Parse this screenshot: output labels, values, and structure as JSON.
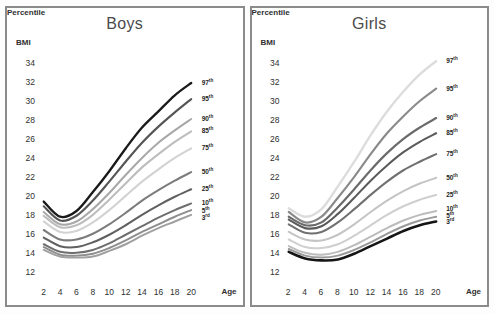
{
  "figure": {
    "background_color": "#fdfdfd",
    "panel_border_color": "#8b8b8b"
  },
  "panels": [
    {
      "id": "boys",
      "title": "Boys",
      "y_axis_name": "BMI",
      "x_axis_name": "Age",
      "legend_title": "Percentile"
    },
    {
      "id": "girls",
      "title": "Girls",
      "y_axis_name": "BMI",
      "x_axis_name": "Age",
      "legend_title": "Percentile"
    }
  ],
  "axis": {
    "y_ticks": [
      34,
      32,
      30,
      28,
      26,
      24,
      22,
      20,
      18,
      16,
      14,
      12
    ],
    "x_ticks": [
      2,
      4,
      6,
      8,
      10,
      12,
      14,
      16,
      18,
      20
    ],
    "ylim": [
      11,
      35
    ],
    "xlim": [
      1.2,
      20.8
    ]
  },
  "chart_data": [
    {
      "type": "line",
      "title": "Boys",
      "xlabel": "Age",
      "ylabel": "BMI",
      "xlim": [
        1.2,
        20.8
      ],
      "ylim": [
        11,
        35
      ],
      "grid": false,
      "legend_position": "right-inline",
      "x": [
        2,
        4,
        6,
        8,
        10,
        12,
        14,
        16,
        18,
        20
      ],
      "series": [
        {
          "name": "97th",
          "label": "97",
          "suffix": "th",
          "color": "#1a1a1a",
          "width": 2.4,
          "values": [
            19.4,
            17.8,
            18.4,
            20.4,
            22.6,
            25.0,
            27.2,
            28.9,
            30.6,
            31.9
          ]
        },
        {
          "name": "95th",
          "label": "95",
          "suffix": "th",
          "color": "#555555",
          "width": 2.2,
          "values": [
            18.9,
            17.4,
            17.9,
            19.5,
            21.5,
            23.6,
            25.6,
            27.3,
            28.8,
            30.2
          ]
        },
        {
          "name": "90th",
          "label": "90",
          "suffix": "th",
          "color": "#a8a8a8",
          "width": 2.1,
          "values": [
            18.3,
            17.0,
            17.3,
            18.6,
            20.3,
            22.2,
            24.0,
            25.6,
            26.9,
            28.1
          ]
        },
        {
          "name": "85th",
          "label": "85",
          "suffix": "th",
          "color": "#bdbdbd",
          "width": 2.1,
          "values": [
            17.9,
            16.7,
            16.9,
            18.0,
            19.6,
            21.3,
            23.0,
            24.4,
            25.7,
            26.8
          ]
        },
        {
          "name": "75th",
          "label": "75",
          "suffix": "th",
          "color": "#d2d2d2",
          "width": 2.1,
          "values": [
            17.3,
            16.2,
            16.3,
            17.2,
            18.5,
            20.0,
            21.5,
            22.8,
            24.0,
            25.0
          ]
        },
        {
          "name": "50th",
          "label": "50",
          "suffix": "th",
          "color": "#7c7c7c",
          "width": 2.1,
          "values": [
            16.4,
            15.4,
            15.4,
            16.0,
            17.0,
            18.2,
            19.5,
            20.6,
            21.6,
            22.5
          ]
        },
        {
          "name": "25th",
          "label": "25",
          "suffix": "th",
          "color": "#606060",
          "width": 2.1,
          "values": [
            15.6,
            14.7,
            14.6,
            15.1,
            15.9,
            16.9,
            18.0,
            19.0,
            19.9,
            20.7
          ]
        },
        {
          "name": "10th",
          "label": "10",
          "suffix": "th",
          "color": "#6e6e6e",
          "width": 2.0,
          "values": [
            14.9,
            14.1,
            14.0,
            14.3,
            15.0,
            15.9,
            16.8,
            17.7,
            18.5,
            19.2
          ]
        },
        {
          "name": "5th",
          "label": "5",
          "suffix": "th",
          "color": "#8e8e8e",
          "width": 2.0,
          "values": [
            14.6,
            13.8,
            13.7,
            13.9,
            14.5,
            15.3,
            16.2,
            17.0,
            17.8,
            18.5
          ]
        },
        {
          "name": "3rd",
          "label": "3",
          "suffix": "rd",
          "color": "#a0a0a0",
          "width": 2.0,
          "values": [
            14.3,
            13.6,
            13.5,
            13.6,
            14.2,
            14.9,
            15.8,
            16.6,
            17.3,
            18.0
          ]
        }
      ]
    },
    {
      "type": "line",
      "title": "Girls",
      "xlabel": "Age",
      "ylabel": "BMI",
      "xlim": [
        1.2,
        20.8
      ],
      "ylim": [
        11,
        35
      ],
      "grid": false,
      "legend_position": "right-inline",
      "x": [
        2,
        4,
        6,
        8,
        10,
        12,
        14,
        16,
        18,
        20
      ],
      "series": [
        {
          "name": "97th",
          "label": "97",
          "suffix": "th",
          "color": "#dcdcdc",
          "width": 2.4,
          "values": [
            18.7,
            17.8,
            18.6,
            21.0,
            23.6,
            26.4,
            28.9,
            31.0,
            32.8,
            34.2
          ]
        },
        {
          "name": "95th",
          "label": "95",
          "suffix": "th",
          "color": "#8a8a8a",
          "width": 2.2,
          "values": [
            18.3,
            17.2,
            17.8,
            19.8,
            22.0,
            24.4,
            26.6,
            28.4,
            30.0,
            31.3
          ]
        },
        {
          "name": "90th",
          "label": "90",
          "suffix": "th",
          "color": "#6a6a6a",
          "width": 2.2,
          "values": [
            17.8,
            16.9,
            17.2,
            18.8,
            20.7,
            22.7,
            24.5,
            26.0,
            27.2,
            28.2
          ]
        },
        {
          "name": "85th",
          "label": "85",
          "suffix": "th",
          "color": "#5a5a5a",
          "width": 2.1,
          "values": [
            17.5,
            16.6,
            16.8,
            18.1,
            19.8,
            21.6,
            23.2,
            24.6,
            25.7,
            26.6
          ]
        },
        {
          "name": "75th",
          "label": "75",
          "suffix": "th",
          "color": "#707070",
          "width": 2.1,
          "values": [
            17.0,
            16.1,
            16.2,
            17.2,
            18.6,
            20.1,
            21.5,
            22.7,
            23.6,
            24.4
          ]
        },
        {
          "name": "50th",
          "label": "50",
          "suffix": "th",
          "color": "#c4c4c4",
          "width": 2.1,
          "values": [
            16.2,
            15.4,
            15.3,
            15.9,
            17.0,
            18.3,
            19.5,
            20.5,
            21.3,
            21.9
          ]
        },
        {
          "name": "25th",
          "label": "25",
          "suffix": "th",
          "color": "#cfcfcf",
          "width": 2.1,
          "values": [
            15.4,
            14.6,
            14.5,
            14.9,
            15.8,
            16.9,
            18.0,
            18.9,
            19.6,
            20.1
          ]
        },
        {
          "name": "10th",
          "label": "10",
          "suffix": "th",
          "color": "#bcbcbc",
          "width": 2.0,
          "values": [
            14.7,
            14.0,
            13.8,
            14.1,
            14.8,
            15.7,
            16.6,
            17.4,
            18.0,
            18.4
          ]
        },
        {
          "name": "5th",
          "label": "5",
          "suffix": "th",
          "color": "#9a9a9a",
          "width": 2.0,
          "values": [
            14.4,
            13.7,
            13.5,
            13.7,
            14.3,
            15.1,
            16.0,
            16.8,
            17.4,
            17.8
          ]
        },
        {
          "name": "3rd",
          "label": "3",
          "suffix": "rd",
          "color": "#151515",
          "width": 2.6,
          "values": [
            14.1,
            13.4,
            13.2,
            13.3,
            13.9,
            14.7,
            15.5,
            16.3,
            16.9,
            17.3
          ]
        }
      ]
    }
  ],
  "legend_label_y": {
    "boys": [
      31.9,
      30.2,
      28.1,
      26.8,
      25.0,
      22.5,
      20.7,
      19.2,
      18.4,
      17.7
    ],
    "girls": [
      34.2,
      31.3,
      28.2,
      26.6,
      24.4,
      21.9,
      20.1,
      18.6,
      17.9,
      17.2
    ]
  }
}
